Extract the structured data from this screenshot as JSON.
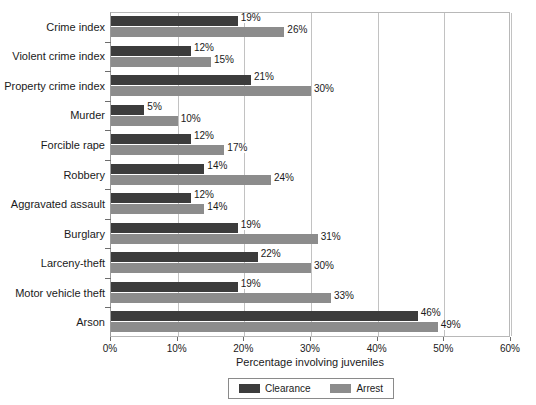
{
  "chart_data": {
    "type": "bar",
    "orientation": "horizontal",
    "title": "",
    "xlabel": "Percentage involving juveniles",
    "ylabel": "",
    "xlim": [
      0,
      60
    ],
    "xtick_labels": [
      "0%",
      "10%",
      "20%",
      "30%",
      "40%",
      "50%",
      "60%"
    ],
    "xticks": [
      0,
      10,
      20,
      30,
      40,
      50,
      60
    ],
    "grid": "vertical",
    "legend_position": "bottom",
    "categories": [
      "Crime index",
      "Violent crime index",
      "Property crime index",
      "Murder",
      "Forcible rape",
      "Robbery",
      "Aggravated assault",
      "Burglary",
      "Larceny-theft",
      "Motor vehicle theft",
      "Arson"
    ],
    "series": [
      {
        "name": "Clearance",
        "color": "#3c3c3c",
        "values": [
          19,
          12,
          21,
          5,
          12,
          14,
          12,
          19,
          22,
          19,
          46
        ],
        "labels": [
          "19%",
          "12%",
          "21%",
          "5%",
          "12%",
          "14%",
          "12%",
          "19%",
          "22%",
          "19%",
          "46%"
        ]
      },
      {
        "name": "Arrest",
        "color": "#8c8c8c",
        "values": [
          26,
          15,
          30,
          10,
          17,
          24,
          14,
          31,
          30,
          33,
          49
        ],
        "labels": [
          "26%",
          "15%",
          "30%",
          "10%",
          "17%",
          "24%",
          "14%",
          "31%",
          "30%",
          "33%",
          "49%"
        ]
      }
    ]
  },
  "legend": {
    "items": [
      {
        "label": "Clearance",
        "color": "#3c3c3c"
      },
      {
        "label": "Arrest",
        "color": "#8c8c8c"
      }
    ]
  }
}
